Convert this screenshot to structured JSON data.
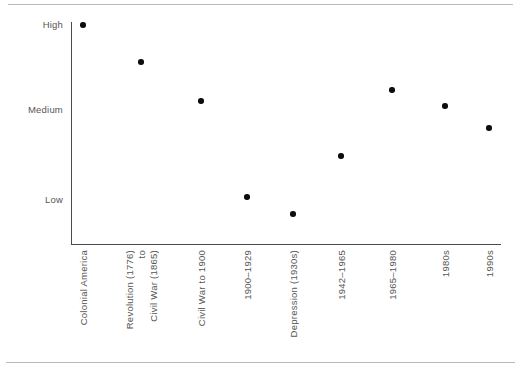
{
  "chart_data": {
    "type": "scatter",
    "title": "",
    "xlabel": "",
    "ylabel": "",
    "grid": false,
    "legend": false,
    "y_ticks": [
      "High",
      "Medium",
      "Low"
    ],
    "ylim": [
      "Low",
      "High"
    ],
    "categories": [
      "Colonial America",
      "Revolution (1776) to Civil War (1865)",
      "Civil War to 1900",
      "1900–1929",
      "Depression (1930s)",
      "1942–1965",
      "1965–1980",
      "1980s",
      "1990s"
    ],
    "category_lines": [
      [
        "Colonial America"
      ],
      [
        "Revolution (1776)",
        "to",
        "Civil War (1865)"
      ],
      [
        "Civil War to 1900"
      ],
      [
        "1900–1929"
      ],
      [
        "Depression (1930s)"
      ],
      [
        "1942–1965"
      ],
      [
        "1965–1980"
      ],
      [
        "1980s"
      ],
      [
        "1990s"
      ]
    ],
    "values": [
      "High",
      "High–Medium",
      "Medium",
      "Low",
      "Below Low",
      "Low–Medium",
      "Medium–High",
      "Medium",
      "Medium"
    ],
    "points": [
      {
        "category": "Colonial America",
        "x_px": 83,
        "y_px": 25,
        "level": "High"
      },
      {
        "category": "Revolution (1776) to Civil War (1865)",
        "x_px": 141,
        "y_px": 62,
        "level": "High–Medium"
      },
      {
        "category": "Civil War to 1900",
        "x_px": 201,
        "y_px": 101,
        "level": "Medium"
      },
      {
        "category": "1900–1929",
        "x_px": 247,
        "y_px": 197,
        "level": "Low"
      },
      {
        "category": "Depression (1930s)",
        "x_px": 293,
        "y_px": 214,
        "level": "Below Low"
      },
      {
        "category": "1942–1965",
        "x_px": 341,
        "y_px": 156,
        "level": "Low–Medium"
      },
      {
        "category": "1965–1980",
        "x_px": 392,
        "y_px": 90,
        "level": "Medium–High"
      },
      {
        "category": "1980s",
        "x_px": 445,
        "y_px": 106,
        "level": "Medium"
      },
      {
        "category": "1990s",
        "x_px": 489,
        "y_px": 128,
        "level": "Medium"
      }
    ],
    "marker_color": "#0d0d0d",
    "axis_color": "#4a4a4a",
    "text_color": "#555555",
    "rule_color": "#b9b9b9"
  },
  "axis": {
    "y_ticks": [
      {
        "label": "High",
        "y_px": 25
      },
      {
        "label": "Medium",
        "y_px": 110
      },
      {
        "label": "Low",
        "y_px": 200
      }
    ],
    "x_labels": [
      {
        "lines": [
          "Colonial America"
        ],
        "x_px": 83
      },
      {
        "lines": [
          "Revolution (1776)",
          "to",
          "Civil War (1865)"
        ],
        "x_px": 141
      },
      {
        "lines": [
          "Civil War to 1900"
        ],
        "x_px": 201
      },
      {
        "lines": [
          "1900–1929"
        ],
        "x_px": 247
      },
      {
        "lines": [
          "Depression (1930s)"
        ],
        "x_px": 293
      },
      {
        "lines": [
          "1942–1965"
        ],
        "x_px": 341
      },
      {
        "lines": [
          "1965–1980"
        ],
        "x_px": 392
      },
      {
        "lines": [
          "1980s"
        ],
        "x_px": 445
      },
      {
        "lines": [
          "1990s"
        ],
        "x_px": 489
      }
    ]
  }
}
